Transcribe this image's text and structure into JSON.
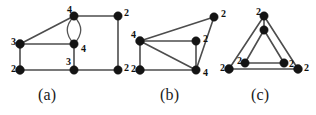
{
  "figure": {
    "width": 316,
    "height": 115,
    "background": "#ffffff",
    "edge_color": "#4d4d4d",
    "vertex_color": "#141414",
    "label_color": "#111111"
  },
  "panels": [
    {
      "id": "a",
      "caption": "(a)",
      "caption_x": 50,
      "caption_y": 86,
      "origin_x": 0,
      "vertices": [
        {
          "id": "a-top",
          "name": "vertex-a-top",
          "cx": 74,
          "cy": 16,
          "r": 4.2,
          "label": "4",
          "lx": 67,
          "ly": 11
        },
        {
          "id": "a-topright",
          "name": "vertex-a-topright",
          "cx": 118,
          "cy": 16,
          "r": 4.2,
          "label": "2",
          "lx": 124,
          "ly": 14
        },
        {
          "id": "a-left",
          "name": "vertex-a-left",
          "cx": 20,
          "cy": 44,
          "r": 4.4,
          "label": "3",
          "lx": 11,
          "ly": 43
        },
        {
          "id": "a-mid",
          "name": "vertex-a-mid",
          "cx": 74,
          "cy": 44,
          "r": 4.2,
          "label": "4",
          "lx": 81,
          "ly": 50
        },
        {
          "id": "a-bottomleft",
          "name": "vertex-a-bottomleft",
          "cx": 20,
          "cy": 70,
          "r": 4.4,
          "label": "2",
          "lx": 11,
          "ly": 70
        },
        {
          "id": "a-bottommid",
          "name": "vertex-a-bottommid",
          "cx": 74,
          "cy": 70,
          "r": 4.2,
          "label": "3",
          "lx": 66,
          "ly": 63
        },
        {
          "id": "a-bottomright",
          "name": "vertex-a-bottomright",
          "cx": 118,
          "cy": 70,
          "r": 4.2,
          "label": "2",
          "lx": 124,
          "ly": 69
        }
      ],
      "edges": [
        {
          "name": "edge-a-left-top",
          "from": "a-left",
          "to": "a-top"
        },
        {
          "name": "edge-a-top-topright",
          "from": "a-top",
          "to": "a-topright"
        },
        {
          "name": "edge-a-left-mid",
          "from": "a-left",
          "to": "a-mid"
        },
        {
          "name": "edge-a-left-bottomleft",
          "from": "a-left",
          "to": "a-bottomleft"
        },
        {
          "name": "edge-a-bottomleft-bottommid",
          "from": "a-bottomleft",
          "to": "a-bottommid"
        },
        {
          "name": "edge-a-mid-bottommid",
          "from": "a-mid",
          "to": "a-bottommid"
        },
        {
          "name": "edge-a-bottommid-bottomright",
          "from": "a-bottommid",
          "to": "a-bottomright"
        },
        {
          "name": "edge-a-topright-bottomright",
          "from": "a-topright",
          "to": "a-bottomright"
        }
      ],
      "multi_edges": [
        {
          "name": "edge-a-top-mid-double-left",
          "d": "M 74 16 C 65 26, 65 34, 74 44"
        },
        {
          "name": "edge-a-top-mid-double-right",
          "d": "M 74 16 C 83 26, 83 34, 74 44"
        }
      ]
    },
    {
      "id": "b",
      "caption": "(b)",
      "caption_x": 172,
      "caption_y": 86,
      "origin_x": 0,
      "vertices": [
        {
          "id": "b-top",
          "name": "vertex-b-top",
          "cx": 214,
          "cy": 17,
          "r": 4.2,
          "label": "2",
          "lx": 221,
          "ly": 15
        },
        {
          "id": "b-left",
          "name": "vertex-b-left",
          "cx": 140,
          "cy": 41,
          "r": 4.4,
          "label": "4",
          "lx": 131,
          "ly": 36
        },
        {
          "id": "b-right",
          "name": "vertex-b-right",
          "cx": 196,
          "cy": 41,
          "r": 4.2,
          "label": "2",
          "lx": 203,
          "ly": 40
        },
        {
          "id": "b-bottomleft",
          "name": "vertex-b-bottomleft",
          "cx": 140,
          "cy": 70,
          "r": 4.4,
          "label": "2",
          "lx": 131,
          "ly": 70
        },
        {
          "id": "b-bottomright",
          "name": "vertex-b-bottomright",
          "cx": 196,
          "cy": 70,
          "r": 4.2,
          "label": "4",
          "lx": 203,
          "ly": 74
        }
      ],
      "edges": [
        {
          "name": "edge-b-left-top",
          "from": "b-left",
          "to": "b-top"
        },
        {
          "name": "edge-b-left-right",
          "from": "b-left",
          "to": "b-right"
        },
        {
          "name": "edge-b-left-bottomleft",
          "from": "b-left",
          "to": "b-bottomleft"
        },
        {
          "name": "edge-b-left-bottomright",
          "from": "b-left",
          "to": "b-bottomright"
        },
        {
          "name": "edge-b-bottomleft-bottomright",
          "from": "b-bottomleft",
          "to": "b-bottomright"
        },
        {
          "name": "edge-b-right-bottomright",
          "from": "b-right",
          "to": "b-bottomright"
        },
        {
          "name": "edge-b-top-bottomright",
          "from": "b-top",
          "to": "b-bottomright"
        }
      ],
      "multi_edges": []
    },
    {
      "id": "c",
      "caption": "(c)",
      "caption_x": 263,
      "caption_y": 86,
      "origin_x": 0,
      "vertices": [
        {
          "id": "c-apex",
          "name": "vertex-c-apex",
          "cx": 264,
          "cy": 16,
          "r": 4.2,
          "label": "2",
          "lx": 256,
          "ly": 13
        },
        {
          "id": "c-inner-top",
          "name": "vertex-c-inner-top",
          "cx": 264,
          "cy": 30,
          "r": 4.2,
          "label": "",
          "lx": 0,
          "ly": 0
        },
        {
          "id": "c-inner-left",
          "name": "vertex-c-inner-left",
          "cx": 245,
          "cy": 63,
          "r": 4.2,
          "label": "2",
          "lx": 237,
          "ly": 62
        },
        {
          "id": "c-inner-right",
          "name": "vertex-c-inner-right",
          "cx": 284,
          "cy": 63,
          "r": 4.2,
          "label": "2",
          "lx": 289,
          "ly": 65
        },
        {
          "id": "c-bottomleft",
          "name": "vertex-c-bottomleft",
          "cx": 229,
          "cy": 69,
          "r": 4.4,
          "label": "2",
          "lx": 220,
          "ly": 69
        },
        {
          "id": "c-bottomright",
          "name": "vertex-c-bottomright",
          "cx": 298,
          "cy": 69,
          "r": 4.4,
          "label": "2",
          "lx": 304,
          "ly": 69
        }
      ],
      "edges": [
        {
          "name": "edge-c-apex-bottomleft",
          "from": "c-apex",
          "to": "c-bottomleft"
        },
        {
          "name": "edge-c-apex-bottomright",
          "from": "c-apex",
          "to": "c-bottomright"
        },
        {
          "name": "edge-c-bottomleft-bottomright",
          "from": "c-bottomleft",
          "to": "c-bottomright"
        },
        {
          "name": "edge-c-innertop-innerleft",
          "from": "c-inner-top",
          "to": "c-inner-left"
        },
        {
          "name": "edge-c-innertop-innerright",
          "from": "c-inner-top",
          "to": "c-inner-right"
        },
        {
          "name": "edge-c-innerleft-innerright",
          "from": "c-inner-left",
          "to": "c-inner-right"
        },
        {
          "name": "edge-c-apex-innertop",
          "from": "c-apex",
          "to": "c-inner-top"
        }
      ],
      "multi_edges": []
    }
  ]
}
